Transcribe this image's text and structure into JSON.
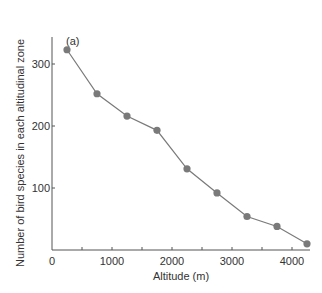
{
  "chart_data": {
    "type": "line",
    "title": "",
    "panel_label": "(a)",
    "xlabel": "Altitude (m)",
    "ylabel": "Number of bird species in each altitudinal zone",
    "x_ticks": [
      0,
      1000,
      2000,
      3000,
      4000
    ],
    "y_ticks": [
      100,
      200,
      300
    ],
    "xlim": [
      0,
      4300
    ],
    "ylim": [
      0,
      345
    ],
    "grid": false,
    "legend": "none",
    "series": [
      {
        "name": "bird species",
        "color": "#7a7a7a",
        "x": [
          250,
          750,
          1250,
          1750,
          2250,
          2750,
          3250,
          3750,
          4250
        ],
        "values": [
          323,
          252,
          216,
          193,
          131,
          92,
          54,
          38,
          10
        ]
      }
    ]
  }
}
